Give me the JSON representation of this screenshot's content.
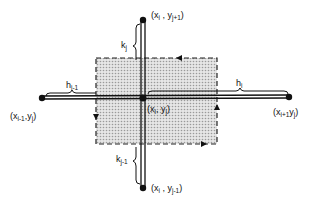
{
  "diagram": {
    "type": "finite-difference grid cell",
    "nodes": {
      "center": {
        "label": "(x",
        "sub1": "i",
        "mid": ", y",
        "sub2": "j",
        "end": ")"
      },
      "top": {
        "label": "(x",
        "sub1": "i",
        "mid": " , y",
        "sub2": "j+1",
        "end": ")"
      },
      "bottom": {
        "label": "(x",
        "sub1": "i",
        "mid": " , y",
        "sub2": "j-1",
        "end": ")"
      },
      "left": {
        "label": "(x",
        "sub1": "i-1",
        "mid": ",y",
        "sub2": "j",
        "end": ")"
      },
      "right": {
        "label": "(x",
        "sub1": "i+1",
        "mid": "y",
        "sub2": "j",
        "end": ")"
      }
    },
    "spacings": {
      "k_top": {
        "base": "k",
        "sub": "j"
      },
      "k_bottom": {
        "base": "k",
        "sub": "j-1"
      },
      "h_left": {
        "base": "h",
        "sub": "i-1"
      },
      "h_right": {
        "base": "h",
        "sub": "i"
      }
    },
    "colors": {
      "ink": "#111111",
      "shade": "#d9d9d9",
      "background": "#ffffff"
    }
  }
}
